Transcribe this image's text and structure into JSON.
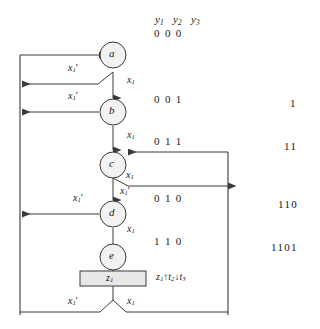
{
  "diagram": {
    "title_row": {
      "y1": "y",
      "y1_sub": "1",
      "y2": "y",
      "y2_sub": "2",
      "y3": "y",
      "y3_sub": "3",
      "bits": "0  0  0"
    },
    "states": [
      {
        "name": "a",
        "bits": "0  0  0"
      },
      {
        "name": "b",
        "bits": "0  0  1"
      },
      {
        "name": "c",
        "bits": "0  1  1"
      },
      {
        "name": "d",
        "bits": "0  1  0"
      },
      {
        "name": "e",
        "bits": "1  1  0"
      }
    ],
    "output_box": {
      "label": "z",
      "label_sub": "1"
    },
    "output_annotation": {
      "z": "z",
      "z_sub": "1",
      "up_arrow": "↑",
      "t2": "t",
      "t2_sub": "2",
      "down_arrow": "↓",
      "t3": "t",
      "t3_sub": "3"
    },
    "edge_labels": {
      "x1": "x",
      "x1_sub": "1",
      "x1_prime_mark": "′"
    },
    "edges": [
      {
        "id": "a-to-b",
        "label": "x1",
        "kind": "x1"
      },
      {
        "id": "a-reset",
        "label": "x1-prime",
        "kind": "x1prime"
      },
      {
        "id": "b-to-c",
        "label": "x1",
        "kind": "x1"
      },
      {
        "id": "b-reset",
        "label": "x1-prime",
        "kind": "x1prime"
      },
      {
        "id": "c-branch-right",
        "label": "x1",
        "kind": "x1"
      },
      {
        "id": "c-to-d",
        "label": "x1-prime",
        "kind": "x1prime"
      },
      {
        "id": "d-to-e",
        "label": "x1",
        "kind": "x1"
      },
      {
        "id": "d-reset",
        "label": "x1-prime",
        "kind": "x1prime"
      },
      {
        "id": "e-exit-left",
        "label": "x1-prime",
        "kind": "x1prime"
      },
      {
        "id": "e-exit-right",
        "label": "x1",
        "kind": "x1"
      }
    ],
    "sequence_labels": [
      "1",
      "11",
      "110",
      "1101"
    ],
    "colors": {
      "line": "#3a3a3a",
      "node_fill": "#f2f2f2",
      "node_stroke": "#3a3a3a",
      "box_fill": "#e8e8e8",
      "box_stroke": "#3a3a3a",
      "text": "#1a1a1a",
      "background": "#ffffff"
    }
  }
}
